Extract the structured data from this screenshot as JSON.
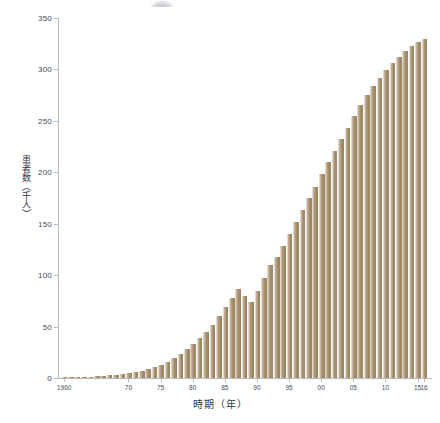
{
  "chart_data": {
    "type": "bar",
    "title": "",
    "xlabel": "時期（年）",
    "ylabel": "患者数（千人）",
    "ylim": [
      0,
      350
    ],
    "yticks": [
      0,
      50,
      100,
      150,
      200,
      250,
      300,
      350
    ],
    "xtick_labels": [
      "1960",
      "70",
      "75",
      "80",
      "85",
      "90",
      "95",
      "00",
      "05",
      "10",
      "15",
      "16"
    ],
    "xtick_years": [
      1960,
      1970,
      1975,
      1980,
      1985,
      1990,
      1995,
      2000,
      2005,
      2010,
      2015,
      2016
    ],
    "grid": false,
    "legend": null,
    "bar_color": "#a08a69",
    "bar_edge_color": "#e2dacb",
    "axis_color": "#b9b9bf",
    "categories": [
      "1960",
      "1961",
      "1962",
      "1963",
      "1964",
      "1965",
      "1966",
      "1967",
      "1968",
      "1969",
      "1970",
      "1971",
      "1972",
      "1973",
      "1974",
      "1975",
      "1976",
      "1977",
      "1978",
      "1979",
      "1980",
      "1981",
      "1982",
      "1983",
      "1984",
      "1985",
      "1986",
      "1987",
      "1988",
      "1989",
      "1990",
      "1991",
      "1992",
      "1993",
      "1994",
      "1995",
      "1996",
      "1997",
      "1998",
      "1999",
      "2000",
      "2001",
      "2002",
      "2003",
      "2004",
      "2005",
      "2006",
      "2007",
      "2008",
      "2009",
      "2010",
      "2011",
      "2012",
      "2013",
      "2014",
      "2015",
      "2016"
    ],
    "values": [
      0.5,
      0.7,
      0.9,
      1.1,
      1.4,
      1.7,
      2.1,
      2.6,
      3.2,
      4.0,
      4.8,
      5.7,
      7.0,
      8.5,
      10.5,
      13.0,
      16.0,
      19.5,
      23.5,
      28.0,
      33.0,
      38.5,
      45.0,
      52.0,
      60.0,
      69.0,
      78.0,
      87.0,
      80.0,
      74.0,
      85.0,
      97.0,
      110.0,
      118.0,
      128.0,
      140.0,
      152.0,
      163.0,
      175.0,
      186.0,
      198.0,
      210.0,
      221.0,
      232.0,
      243.0,
      255.0,
      265.0,
      275.0,
      284.0,
      292.0,
      299.0,
      306.0,
      312.0,
      318.0,
      323.0,
      327.0,
      330.0
    ]
  }
}
